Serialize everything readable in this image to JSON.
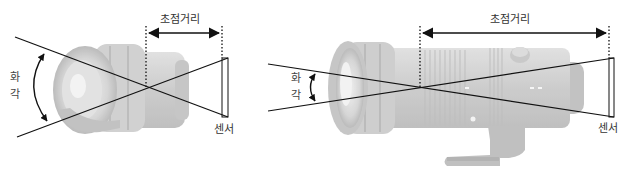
{
  "diagram": {
    "colors": {
      "background": "#ffffff",
      "line": "#111111",
      "lens_body": "#c8c8c8",
      "lens_shadow": "#a9a9a9",
      "label_text": "#333333"
    },
    "left_panel": {
      "lens_type": "wide-angle lens",
      "focal_length_label": "초점거리",
      "angle_of_view_label": [
        "화",
        "각"
      ],
      "sensor_label": "센서"
    },
    "right_panel": {
      "lens_type": "telephoto lens with tripod foot",
      "focal_length_label": "초점거리",
      "angle_of_view_label": [
        "화",
        "각"
      ],
      "sensor_label": "센서"
    }
  }
}
